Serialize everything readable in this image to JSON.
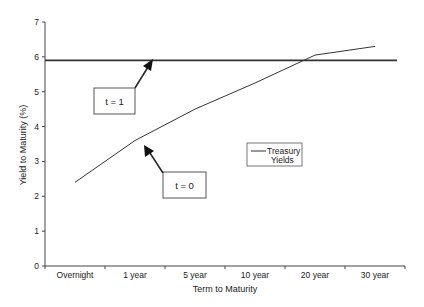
{
  "chart_data": {
    "type": "line",
    "title": "",
    "xlabel": "Term to Maturity",
    "ylabel": "Yield to Maturity (%)",
    "ylim": [
      0,
      7
    ],
    "yticks": [
      0,
      1,
      2,
      3,
      4,
      5,
      6,
      7
    ],
    "grid": false,
    "categories": [
      "Overnight",
      "1 year",
      "5 year",
      "10 year",
      "20 year",
      "30 year"
    ],
    "series": [
      {
        "name": "Treasury Yields",
        "values": [
          2.4,
          3.6,
          4.5,
          5.25,
          6.05,
          6.3
        ],
        "color": "#333333"
      },
      {
        "name": "Flat yield (t = 1)",
        "values": [
          5.9,
          5.9,
          5.9,
          5.9,
          5.9,
          5.9
        ],
        "color": "#333333",
        "style": "horizontal-line spanning full axis"
      }
    ],
    "legend": {
      "entries": [
        "Treasury Yields"
      ],
      "position": "inside-center-right"
    },
    "annotations": [
      {
        "label": "t = 1",
        "points_to": "flat line at ~5.9%"
      },
      {
        "label": "t = 0",
        "points_to": "Treasury yield curve near 1 year"
      }
    ]
  },
  "annotations": {
    "t1": "t = 1",
    "t0": "t = 0"
  },
  "legend": {
    "line1": "Treasury",
    "line2": "Yields"
  }
}
